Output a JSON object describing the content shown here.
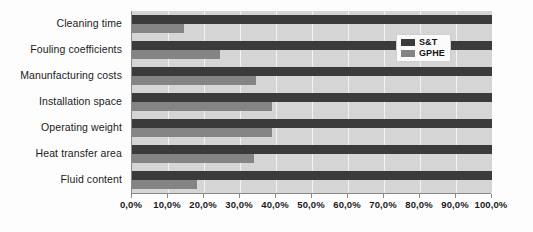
{
  "chart_data": {
    "type": "bar",
    "orientation": "horizontal",
    "title": "",
    "xlabel": "",
    "ylabel": "",
    "xlim": [
      0,
      100
    ],
    "grid": true,
    "legend_position": "top-right-inside",
    "categories": [
      "Cleaning time",
      "Fouling coefficients",
      "Manunfacturing costs",
      "Installation space",
      "Operating weight",
      "Heat transfer area",
      "Fluid content"
    ],
    "series": [
      {
        "name": "S&T",
        "color": "#3b3b3b",
        "values": [
          100.0,
          100.0,
          100.0,
          100.0,
          100.0,
          100.0,
          100.0
        ]
      },
      {
        "name": "GPHE",
        "color": "#848484",
        "values": [
          14.5,
          24.5,
          34.5,
          39.0,
          39.0,
          34.0,
          18.0
        ]
      }
    ],
    "tick_values": [
      0,
      10,
      20,
      30,
      40,
      50,
      60,
      70,
      80,
      90,
      100
    ],
    "tick_labels": [
      "0,0%",
      "10,0%",
      "20,0%",
      "30,0%",
      "40,0%",
      "50,0%",
      "60,0%",
      "70,0%",
      "80,0%",
      "90,0%",
      "100,0%"
    ]
  },
  "legend": {
    "entries": [
      {
        "label": "S&T",
        "color": "#3b3b3b"
      },
      {
        "label": "GPHE",
        "color": "#848484"
      }
    ]
  },
  "colors": {
    "plot_background": "#d5d5d5",
    "gridline": "#f2f2f2",
    "axis_line": "#8a8a8a",
    "series_st": "#3b3b3b",
    "series_gphe": "#848484",
    "text": "#1b1b1b"
  }
}
